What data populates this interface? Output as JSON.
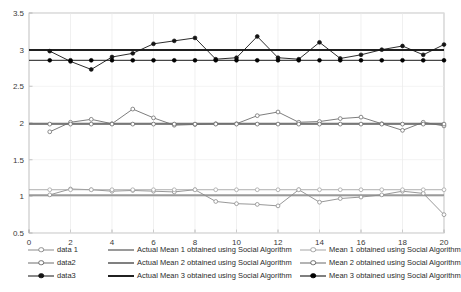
{
  "chart_data": {
    "type": "line",
    "title": "",
    "xlabel": "",
    "ylabel": "",
    "xlim": [
      0,
      20
    ],
    "ylim": [
      0.5,
      3.5
    ],
    "xticks": [
      0,
      2,
      4,
      6,
      8,
      10,
      12,
      14,
      16,
      18,
      20
    ],
    "yticks": [
      0.5,
      1,
      1.5,
      2,
      2.5,
      3,
      3.5
    ],
    "xtick_labels": [
      "0",
      "2",
      "4",
      "6",
      "8",
      "10",
      "12",
      "14",
      "16",
      "18",
      "20"
    ],
    "ytick_labels": [
      "0.5",
      "1",
      "1.5",
      "2",
      "2.5",
      "3",
      "3.5"
    ],
    "grid": true,
    "legend_position": "below-axes",
    "x": [
      1,
      2,
      3,
      4,
      5,
      6,
      7,
      8,
      9,
      10,
      11,
      12,
      13,
      14,
      15,
      16,
      17,
      18,
      19,
      20
    ],
    "series": [
      {
        "name": "data 1",
        "role": "data",
        "color": "#8c8c8c",
        "marker": "circle-open",
        "values": [
          1.02,
          1.1,
          1.09,
          1.07,
          1.08,
          1.07,
          1.06,
          1.09,
          0.93,
          0.9,
          0.89,
          0.87,
          1.09,
          0.92,
          0.97,
          0.99,
          1.02,
          1.07,
          1.04,
          0.75
        ]
      },
      {
        "name": "data2",
        "role": "data",
        "color": "#6e6e6e",
        "marker": "circle-open",
        "values": [
          1.88,
          2.01,
          2.05,
          1.99,
          2.19,
          2.07,
          1.97,
          1.98,
          1.99,
          1.99,
          2.1,
          2.15,
          2.01,
          2.02,
          2.06,
          2.08,
          1.99,
          1.9,
          2.01,
          1.96
        ]
      },
      {
        "name": "data3",
        "role": "data",
        "color": "#141414",
        "marker": "circle-filled",
        "values": [
          2.98,
          2.84,
          2.73,
          2.9,
          2.95,
          3.08,
          3.12,
          3.16,
          2.87,
          2.89,
          3.18,
          2.89,
          2.87,
          3.1,
          2.88,
          2.93,
          3.0,
          3.05,
          2.93,
          3.07
        ]
      },
      {
        "name": "Actual Mean 1 obtained using Social Algorithm",
        "role": "actual-mean",
        "color": "#9a9a9a",
        "marker": "none",
        "value": 1.015
      },
      {
        "name": "Actual Mean 2 obtained using Social Algorithm",
        "role": "actual-mean",
        "color": "#808080",
        "marker": "none",
        "value": 1.99
      },
      {
        "name": "Actual Mean 3 obtained using Social Algorithm",
        "role": "actual-mean",
        "color": "#202020",
        "marker": "none",
        "value": 2.995
      },
      {
        "name": "Mean 1 obtained using Social Algorithm",
        "role": "mean",
        "color": "#a5a5a5",
        "marker": "circle-open",
        "value": 1.09
      },
      {
        "name": "Mean 2 obtained using Social Algorithm",
        "role": "mean",
        "color": "#6b6b6b",
        "marker": "circle-open",
        "value": 1.985
      },
      {
        "name": "Mean 3 obtained using Social Algorithm",
        "role": "mean",
        "color": "#000000",
        "marker": "circle-filled",
        "value": 2.855
      }
    ]
  },
  "legend": {
    "columns": [
      {
        "entries": [
          {
            "label": "data 1"
          },
          {
            "label": "data2"
          },
          {
            "label": "data3"
          }
        ]
      },
      {
        "entries": [
          {
            "label": "Actual Mean 1 obtained using Social Algorithm"
          },
          {
            "label": "Actual Mean 2 obtained using Social Algorithm"
          },
          {
            "label": "Actual Mean 3 obtained using Social Algorithm"
          }
        ]
      },
      {
        "entries": [
          {
            "label": "Mean 1 obtained using Social Algorithm"
          },
          {
            "label": "Mean 2 obtained using Social Algorithm"
          },
          {
            "label": "Mean 3 obtained using Social Algorithm"
          }
        ]
      }
    ]
  }
}
